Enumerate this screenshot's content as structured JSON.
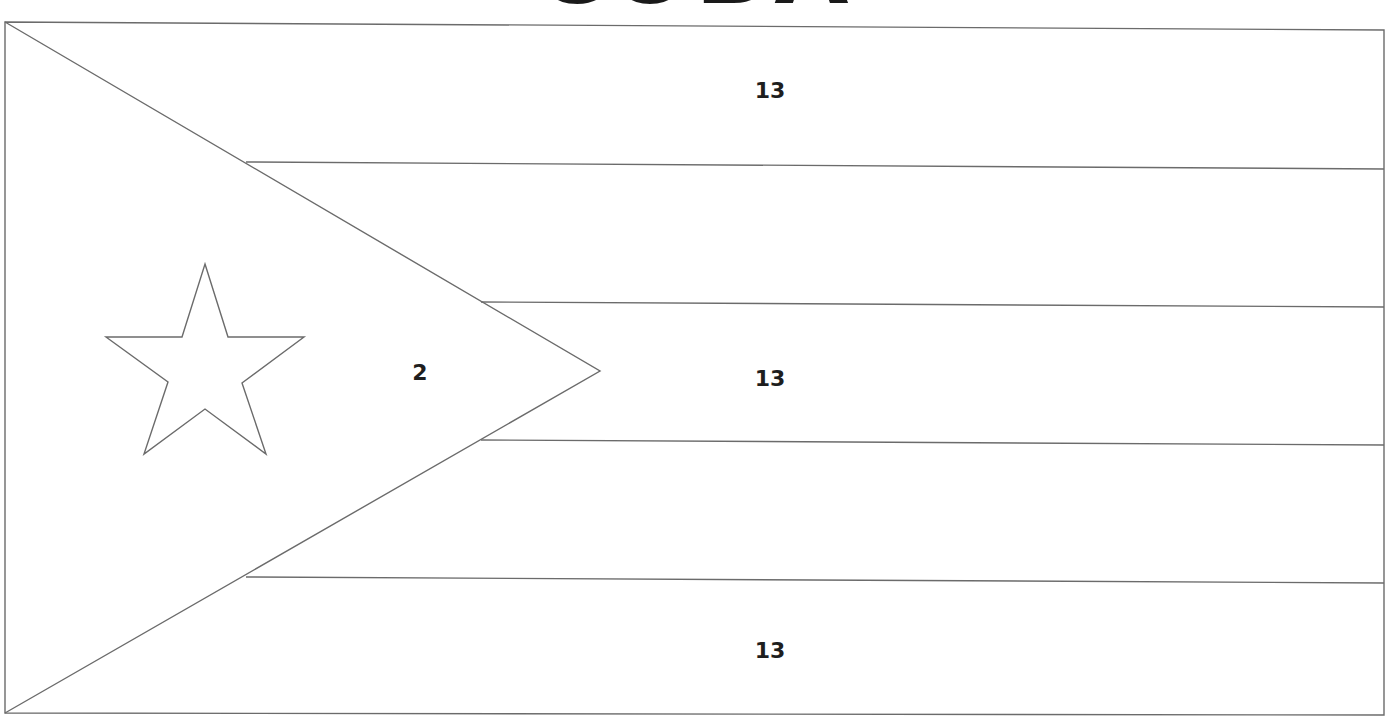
{
  "title": "CUBA",
  "flag": {
    "frame": {
      "x1": 5,
      "y1": 22,
      "x2": 1384,
      "y2": 715
    },
    "stripe_lines": [
      {
        "x1": 246,
        "y1": 162,
        "x2": 1384,
        "y2": 169
      },
      {
        "x1": 481,
        "y1": 302,
        "x2": 1384,
        "y2": 307
      },
      {
        "x1": 481,
        "y1": 440,
        "x2": 1384,
        "y2": 445
      },
      {
        "x1": 246,
        "y1": 577,
        "x2": 1384,
        "y2": 583
      }
    ],
    "triangle": {
      "apex_x": 600,
      "apex_y": 371
    },
    "star": {
      "cx": 205,
      "cy": 370,
      "outer_r": 105,
      "inner_r": 42
    }
  },
  "labels": [
    {
      "region": "top-stripe",
      "text": "13",
      "x": 770,
      "y": 92
    },
    {
      "region": "middle-stripe",
      "text": "13",
      "x": 770,
      "y": 380
    },
    {
      "region": "bottom-stripe",
      "text": "13",
      "x": 770,
      "y": 652
    },
    {
      "region": "triangle",
      "text": "2",
      "x": 420,
      "y": 374
    }
  ],
  "colors": {
    "line": "#6b6b6b",
    "text": "#1e1e1e",
    "background": "#ffffff"
  }
}
